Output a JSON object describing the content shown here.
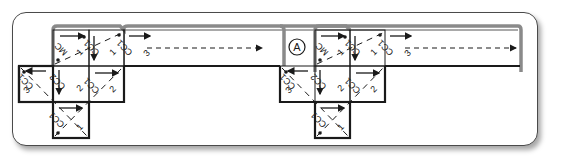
{
  "diagram": {
    "marker_label": "A",
    "cell_labels": {
      "mc": "MC",
      "cc1": "CC1",
      "cc2": "CC2",
      "cc3": "CC3",
      "n1": "1",
      "n2": "2",
      "n3": "3"
    },
    "groups": [
      {
        "name": "group-left",
        "cells": [
          {
            "row": 0,
            "col": 1,
            "label": "MC",
            "index": "1",
            "arrow": "right"
          },
          {
            "row": 0,
            "col": 2,
            "label": "CC1",
            "index": "1",
            "arrow": "down"
          },
          {
            "row": 0,
            "col": 3,
            "label": "CC1",
            "index": "3",
            "arrow": "right-dashed-long"
          },
          {
            "row": 1,
            "col": 0,
            "label": "CC1",
            "index": "3",
            "arrow": "left"
          },
          {
            "row": 1,
            "col": 1,
            "label": "CC2",
            "index": "2",
            "arrow": "down"
          },
          {
            "row": 1,
            "col": 2,
            "label": "CC1",
            "index": "2",
            "arrow": "right"
          },
          {
            "row": 2,
            "col": 1,
            "label": "CC1",
            "index": "1",
            "arrow": "right"
          }
        ]
      },
      {
        "name": "group-right",
        "cells": [
          {
            "row": 0,
            "col": 1,
            "label": "MC",
            "index": "1",
            "arrow": "right"
          },
          {
            "row": 0,
            "col": 2,
            "label": "CC1",
            "index": "1",
            "arrow": "down"
          },
          {
            "row": 0,
            "col": 3,
            "label": "CC1",
            "index": "3",
            "arrow": "right-dashed-long"
          },
          {
            "row": 1,
            "col": 0,
            "label": "CC1",
            "index": "3",
            "arrow": "left"
          },
          {
            "row": 1,
            "col": 1,
            "label": "CC2",
            "index": "2",
            "arrow": "down"
          },
          {
            "row": 1,
            "col": 2,
            "label": "CC1",
            "index": "2",
            "arrow": "right"
          },
          {
            "row": 2,
            "col": 1,
            "label": "CC1",
            "index": "1",
            "arrow": "right"
          }
        ]
      }
    ],
    "colors": {
      "line": "#1a1a1a",
      "fold": "#8a8a8a",
      "frame": "#4a4a4a"
    }
  }
}
